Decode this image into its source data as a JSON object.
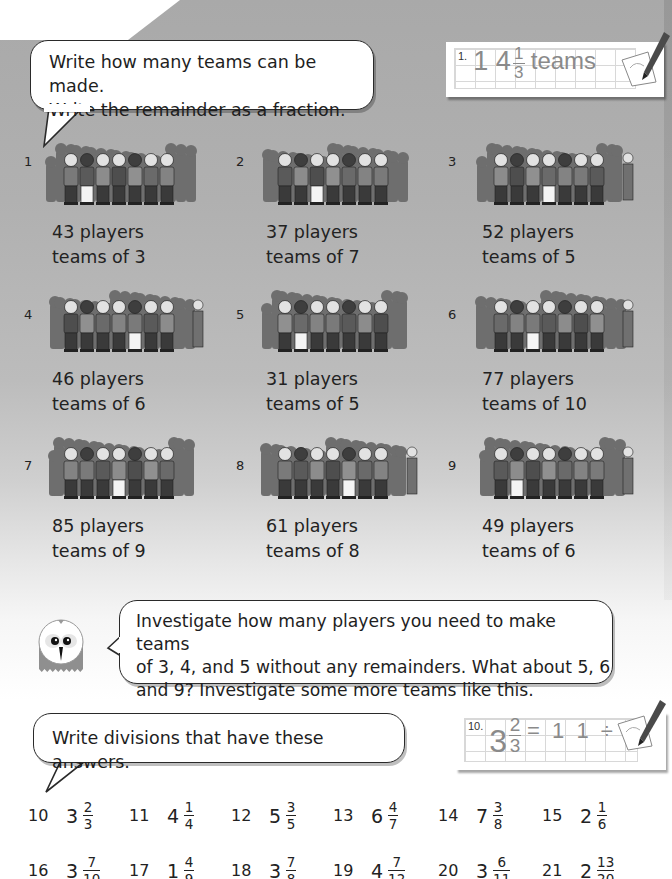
{
  "instruction_1": {
    "line1": "Write how many teams can be made.",
    "line2": "Write the remainder as a fraction."
  },
  "example_card_1": {
    "number": "1.",
    "whole": "1 4",
    "numerator": "1",
    "denominator": "3",
    "unit": "teams"
  },
  "problems": [
    {
      "number": "1",
      "players": "43 players",
      "teams": "teams of 3"
    },
    {
      "number": "2",
      "players": "37 players",
      "teams": "teams of 7"
    },
    {
      "number": "3",
      "players": "52 players",
      "teams": "teams of 5"
    },
    {
      "number": "4",
      "players": "46 players",
      "teams": "teams of 6"
    },
    {
      "number": "5",
      "players": "31 players",
      "teams": "teams of 5"
    },
    {
      "number": "6",
      "players": "77 players",
      "teams": "teams of 10"
    },
    {
      "number": "7",
      "players": "85 players",
      "teams": "teams of 9"
    },
    {
      "number": "8",
      "players": "61 players",
      "teams": "teams of 8"
    },
    {
      "number": "9",
      "players": "49 players",
      "teams": "teams of 6"
    }
  ],
  "investigate": {
    "line1": "Investigate how many players you need to make teams",
    "line2": "of 3, 4, and 5 without any remainders. What about 5, 6",
    "line3": "and 9? Investigate some more teams like this."
  },
  "instruction_2": {
    "text": "Write divisions that have these answers."
  },
  "example_card_2": {
    "number": "10.",
    "whole": "3",
    "numerator": "2",
    "denominator": "3",
    "equation": "= 1 1 ÷ 3"
  },
  "answers": [
    {
      "number": "10",
      "whole": "3",
      "numerator": "2",
      "denominator": "3"
    },
    {
      "number": "11",
      "whole": "4",
      "numerator": "1",
      "denominator": "4"
    },
    {
      "number": "12",
      "whole": "5",
      "numerator": "3",
      "denominator": "5"
    },
    {
      "number": "13",
      "whole": "6",
      "numerator": "4",
      "denominator": "7"
    },
    {
      "number": "14",
      "whole": "7",
      "numerator": "3",
      "denominator": "8"
    },
    {
      "number": "15",
      "whole": "2",
      "numerator": "1",
      "denominator": "6"
    },
    {
      "number": "16",
      "whole": "3",
      "numerator": "7",
      "denominator": "10"
    },
    {
      "number": "17",
      "whole": "1",
      "numerator": "4",
      "denominator": "9"
    },
    {
      "number": "18",
      "whole": "3",
      "numerator": "7",
      "denominator": "8"
    },
    {
      "number": "19",
      "whole": "4",
      "numerator": "7",
      "denominator": "12"
    },
    {
      "number": "20",
      "whole": "3",
      "numerator": "6",
      "denominator": "11"
    },
    {
      "number": "21",
      "whole": "2",
      "numerator": "13",
      "denominator": "20"
    }
  ],
  "icons": {
    "owl": "owl-mascot-icon",
    "pencil": "pencil-icon",
    "crowd": "crowd-of-players-illustration"
  },
  "colors": {
    "background_top": "#a9a9a9",
    "background_bottom": "#ffffff",
    "text": "#1e1e1e",
    "card_text": "#8a8a8a"
  }
}
